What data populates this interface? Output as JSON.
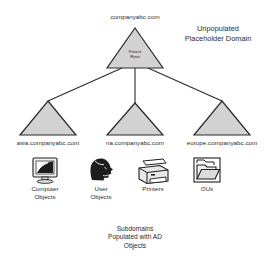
{
  "diagram": {
    "title_label": "companyabc.com",
    "root": {
      "name": "forest-root",
      "line1": "Forest",
      "line2": "Root"
    },
    "annotation": {
      "line1": "Unpopulated",
      "line2": "Placeholder Domain"
    },
    "subdomains": [
      {
        "label": "asia.companyabc.com"
      },
      {
        "label": "na.companyabc.com"
      },
      {
        "label": "europe.companyabc.com"
      }
    ],
    "objects": [
      {
        "icon": "computer-monitor-icon",
        "line1": "Computer",
        "line2": "Objects"
      },
      {
        "icon": "user-head-icon",
        "line1": "User",
        "line2": "Objects"
      },
      {
        "icon": "printer-icon",
        "line1": "Printers",
        "line2": ""
      },
      {
        "icon": "folder-icon",
        "line1": "OUs",
        "line2": ""
      }
    ],
    "caption": {
      "line1": "Subdomains",
      "line2": "Populated with AD",
      "line3": "Objects"
    },
    "colors": {
      "triangle_fill": "#d2d2d2",
      "triangle_stroke": "#2a2a2a",
      "connector": "#2a2a2a",
      "text": "#2b2b2b",
      "background": "#ffffff"
    }
  }
}
